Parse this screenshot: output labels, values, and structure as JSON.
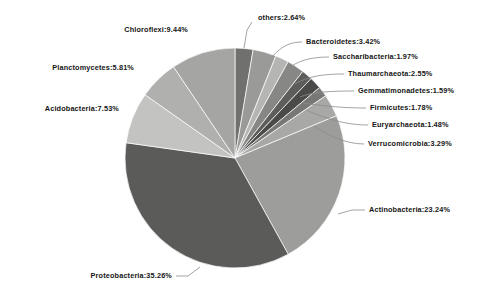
{
  "chart_data": {
    "type": "pie",
    "title": "",
    "subtitle": "",
    "xlabel": "",
    "ylabel": "",
    "legend_position": "none",
    "grid": false,
    "value_unit": "%",
    "start_angle_deg": 0,
    "direction": "clockwise",
    "categories": [
      "others",
      "Bacteroidetes",
      "Saccharibacteria",
      "Thaumarchaeota",
      "Gemmatimonadetes",
      "Firmicutes",
      "Euryarchaeota",
      "Verrucomicrobia",
      "Actinobacteria",
      "Proteobacteria",
      "Acidobacteria",
      "Planctomycetes",
      "Chloroflexi"
    ],
    "values": [
      2.64,
      3.42,
      1.97,
      2.55,
      1.59,
      1.78,
      1.48,
      3.29,
      23.24,
      35.26,
      7.53,
      5.81,
      9.44
    ],
    "colors": [
      "#70706f",
      "#9a9a99",
      "#b5b5b4",
      "#878786",
      "#5d5d5c",
      "#4a4a49",
      "#787877",
      "#a8a8a7",
      "#9d9d9c",
      "#5b5b5a",
      "#c3c3c2",
      "#b0b0af",
      "#a5a5a4"
    ],
    "labels": [
      "others:2.64%",
      "Bacteroidetes:3.42%",
      "Saccharibacteria:1.97%",
      "Thaumarchaeota:2.55%",
      "Gemmatimonadetes:1.59%",
      "Firmicutes:1.78%",
      "Euryarchaeota:1.48%",
      "Verrucomicrobia:3.29%",
      "Actinobacteria:23.24%",
      "Proteobacteria:35.26%",
      "Acidobacteria:7.53%",
      "Planctomycetes:5.81%",
      "Chloroflexi:9.44%"
    ]
  },
  "style": {
    "background": "#ffffff",
    "leader_line_color": "#8b8b8b",
    "label_color": "#151515",
    "pie_center_x": 235,
    "pie_center_y": 158,
    "pie_radius": 110
  },
  "label_layout": [
    {
      "key": "others",
      "x": 258,
      "y": 14,
      "align": "left"
    },
    {
      "key": "Bacteroidetes",
      "x": 306,
      "y": 38,
      "align": "left"
    },
    {
      "key": "Saccharibacteria",
      "x": 333,
      "y": 53,
      "align": "left"
    },
    {
      "key": "Thaumarchaeota",
      "x": 348,
      "y": 70,
      "align": "left"
    },
    {
      "key": "Gemmatimonadetes",
      "x": 358,
      "y": 87,
      "align": "left"
    },
    {
      "key": "Firmicutes",
      "x": 370,
      "y": 104,
      "align": "left"
    },
    {
      "key": "Euryarchaeota",
      "x": 372,
      "y": 121,
      "align": "left"
    },
    {
      "key": "Verrucomicrobia",
      "x": 368,
      "y": 140,
      "align": "left"
    },
    {
      "key": "Actinobacteria",
      "x": 369,
      "y": 206,
      "align": "left"
    },
    {
      "key": "Proteobacteria",
      "x": 172,
      "y": 272,
      "align": "right"
    },
    {
      "key": "Acidobacteria",
      "x": 119,
      "y": 105,
      "align": "right"
    },
    {
      "key": "Planctomycetes",
      "x": 134,
      "y": 64,
      "align": "right"
    },
    {
      "key": "Chloroflexi",
      "x": 188,
      "y": 26,
      "align": "right"
    }
  ],
  "leader_lines": [
    {
      "key": "others",
      "path": "M 252 22 L 247 30 L 244 48"
    },
    {
      "key": "Bacteroidetes",
      "path": "M 302 42 C 292 42 282 45 272 57"
    },
    {
      "key": "Saccharibacteria",
      "path": "M 329 57 C 312 57 298 60 286 70"
    },
    {
      "key": "Thaumarchaeota",
      "path": "M 344 74 C 324 74 308 76 295 84"
    },
    {
      "key": "Gemmatimonadetes",
      "path": "M 354 91 C 330 91 312 92 300 97"
    },
    {
      "key": "Firmicutes",
      "path": "M 366 108 C 338 108 316 105 303 103"
    },
    {
      "key": "Euryarchaeota",
      "path": "M 368 125 C 340 125 318 115 306 110"
    },
    {
      "key": "Verrucomicrobia",
      "path": "M 364 144 C 344 144 326 134 314 126"
    },
    {
      "key": "Actinobacteria",
      "path": "M 365 210 L 352 210 L 338 214"
    },
    {
      "key": "Proteobacteria",
      "path": "M 176 276 L 188 276 L 200 267"
    }
  ]
}
